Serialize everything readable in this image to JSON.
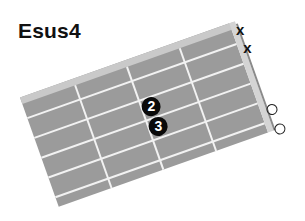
{
  "chord": {
    "name": "Esus4",
    "strings": [
      {
        "index": 1,
        "state": "muted",
        "symbol": "x"
      },
      {
        "index": 2,
        "state": "muted",
        "symbol": "x"
      },
      {
        "index": 3,
        "state": "fretted",
        "finger": "2"
      },
      {
        "index": 4,
        "state": "fretted",
        "finger": "3"
      },
      {
        "index": 5,
        "state": "open",
        "symbol": "o"
      },
      {
        "index": 6,
        "state": "open",
        "symbol": "o"
      }
    ]
  },
  "fretboard": {
    "frets_shown": 4,
    "string_count": 6,
    "board_color": "#9b9b9b",
    "line_color": "#f2f2f2",
    "nut_color": "#d4d4d4",
    "dot_color": "#0a0a0a"
  },
  "markers": {
    "mute_1": "x",
    "mute_2": "x",
    "finger_a": "2",
    "finger_b": "3"
  }
}
